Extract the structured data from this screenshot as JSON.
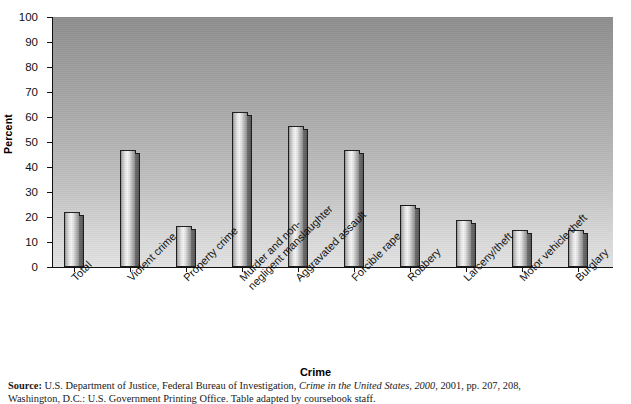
{
  "chart_data": {
    "type": "bar",
    "title": "",
    "xlabel": "Crime",
    "ylabel": "Percent",
    "ylim": [
      0,
      100
    ],
    "yticks": [
      0,
      10,
      20,
      30,
      40,
      50,
      60,
      70,
      80,
      90,
      100
    ],
    "grid": false,
    "legend": null,
    "categories": [
      "Total",
      "Violent crime",
      "Property crime",
      "Murder and non-\nnegligent manslaughter",
      "Aggravated assault",
      "Forcible rape",
      "Robbery",
      "Larceny/theft",
      "Motor vehicle theft",
      "Burglary"
    ],
    "values": [
      22,
      47,
      16.5,
      62,
      56.5,
      47,
      25,
      19,
      15,
      15
    ]
  },
  "axes": {
    "y_title": "Percent",
    "x_title": "Crime",
    "y_tick_labels": [
      "100",
      "90",
      "80",
      "70",
      "60",
      "50",
      "40",
      "30",
      "20",
      "10",
      "0"
    ]
  },
  "source": {
    "label": "Source:",
    "line1": " U.S. Department of Justice, Federal Bureau of Investigation, ",
    "italic1": "Crime in the United States, 2000,",
    "line1b": " 2001, pp. 207, 208,",
    "line2": "Washington, D.C.: U.S. Government Printing Office. Table adapted by coursebook staff."
  }
}
